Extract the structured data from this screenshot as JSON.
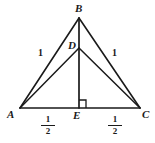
{
  "figure": {
    "type": "geometry-diagram",
    "background_color": "#ffffff",
    "stroke_color": "#1a1a1a",
    "vertices": [
      {
        "id": "A",
        "label": "A",
        "x": 20,
        "y": 108
      },
      {
        "id": "B",
        "label": "B",
        "x": 79,
        "y": 18
      },
      {
        "id": "C",
        "label": "C",
        "x": 140,
        "y": 108
      },
      {
        "id": "D",
        "label": "D",
        "x": 79,
        "y": 48
      },
      {
        "id": "E",
        "label": "E",
        "x": 79,
        "y": 108
      }
    ],
    "vertex_labels": {
      "A": "A",
      "B": "B",
      "C": "C",
      "D": "D",
      "E": "E"
    },
    "segments": [
      {
        "name": "A-B",
        "from": "A",
        "to": "B"
      },
      {
        "name": "B-C",
        "from": "B",
        "to": "C"
      },
      {
        "name": "A-C",
        "from": "A",
        "to": "C"
      },
      {
        "name": "A-D",
        "from": "A",
        "to": "D"
      },
      {
        "name": "D-C",
        "from": "D",
        "to": "C"
      },
      {
        "name": "B-E",
        "from": "B",
        "to": "E"
      }
    ],
    "measure_labels": [
      {
        "name": "side-ab-length",
        "text": "1",
        "x": 38,
        "y": 48
      },
      {
        "name": "side-bc-length",
        "text": "1",
        "x": 112,
        "y": 48
      }
    ],
    "base_fractions": [
      {
        "name": "segment-ae-length",
        "numerator": "1",
        "denominator": "2",
        "x": 41,
        "y": 113
      },
      {
        "name": "segment-ec-length",
        "numerator": "1",
        "denominator": "2",
        "x": 108,
        "y": 113
      }
    ],
    "right_angle": {
      "name": "right-angle-at-e",
      "at_vertex": "E",
      "x": 79,
      "y": 100,
      "size": 7
    }
  }
}
